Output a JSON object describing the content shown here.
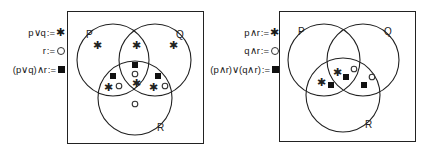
{
  "figures": [
    {
      "id": "left",
      "legend": [
        {
          "expression": "p∨q",
          "assign": ":=",
          "symbol": "asterisk",
          "glyph": "✱"
        },
        {
          "expression": "r",
          "assign": ":=",
          "symbol": "circle",
          "glyph": "○"
        },
        {
          "expression": "(p∨q)∧r",
          "assign": ":=",
          "symbol": "square",
          "glyph": "■"
        }
      ],
      "sets": {
        "P": "P",
        "Q": "Q",
        "R": "R"
      }
    },
    {
      "id": "right",
      "legend": [
        {
          "expression": "p∧r",
          "assign": ":=",
          "symbol": "asterisk",
          "glyph": "✱"
        },
        {
          "expression": "q∧r",
          "assign": ":=",
          "symbol": "circle",
          "glyph": "○"
        },
        {
          "expression": "(p∧r)∨(q∧r)",
          "assign": ":=",
          "symbol": "square",
          "glyph": "■"
        }
      ],
      "sets": {
        "P": "P",
        "Q": "Q",
        "R": "R"
      }
    }
  ],
  "colors": {
    "stroke": "#222222",
    "background": "#ffffff",
    "marker": "#111111"
  }
}
